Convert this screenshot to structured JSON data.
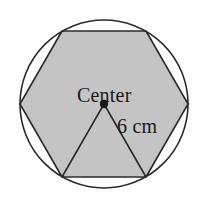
{
  "figure": {
    "type": "geometry-diagram",
    "background_color": "#ffffff",
    "labels": {
      "center": "Center",
      "radius": "6 cm"
    },
    "colors": {
      "hexagon_fill": "#c4c4c4",
      "stroke": "#2b2b2b",
      "center_dot": "#1a1a1a",
      "text": "#1a1a1a"
    },
    "circle": {
      "center_x": 104,
      "center_y": 104,
      "radius": 84,
      "stroke_width": 1.6,
      "fill": "none"
    },
    "hexagon": {
      "sides": 6,
      "inscribed": true,
      "circumradius": 84,
      "points": "20,104 62,31 146,31 188,104 146,177 62,177",
      "stroke_width": 1.6
    },
    "radius_triangle": {
      "description": "Triangle from center to the two bottom hexagon vertices",
      "points": "104,104 62,177 146,177",
      "stroke_width": 1.6
    },
    "center_dot": {
      "cx": 104,
      "cy": 104,
      "r": 4.2
    }
  }
}
